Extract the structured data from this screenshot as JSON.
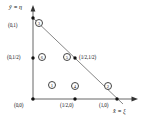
{
  "figure": {
    "axes": {
      "y_label": "ŷ ≡ η",
      "x_label": "x̂ ≡ ξ",
      "origin_label": "(0,0)"
    },
    "colors": {
      "line": "#4a4a4a",
      "axis": "#555555",
      "node": "#111111",
      "background": "#ffffff"
    },
    "vertices": [
      {
        "name": "origin",
        "coords": "(0,0)"
      },
      {
        "name": "x-vertex",
        "coords": "(1,0)"
      },
      {
        "name": "y-vertex",
        "coords": "(0,1)"
      }
    ],
    "nodes": [
      {
        "id": "1",
        "number": "1",
        "coord_label": "(0,0)",
        "x": 0.0,
        "y": 0.0,
        "label_pos": "below-left",
        "num_x": 48,
        "num_y": 81,
        "lbl_x": 14,
        "lbl_y": 103,
        "marker": true,
        "mx": 33,
        "my": 99
      },
      {
        "id": "2",
        "number": "2",
        "coord_label": "(1,0)",
        "x": 1.0,
        "y": 0.0,
        "label_pos": "below",
        "num_x": 104,
        "num_y": 82,
        "lbl_x": 99,
        "lbl_y": 103,
        "marker": true,
        "mx": 117,
        "my": 99
      },
      {
        "id": "3",
        "number": "3",
        "coord_label": "(0,1)",
        "x": 0.0,
        "y": 1.0,
        "label_pos": "left",
        "num_x": 35,
        "num_y": 19,
        "lbl_x": 8,
        "lbl_y": 23,
        "marker": true,
        "mx": 33,
        "my": 18
      },
      {
        "id": "4",
        "number": "4",
        "coord_label": "(1/2,0)",
        "x": 0.5,
        "y": 0.0,
        "label_pos": "below",
        "num_x": 71,
        "num_y": 82,
        "lbl_x": 60,
        "lbl_y": 103,
        "marker": true,
        "mx": 75,
        "my": 99
      },
      {
        "id": "5",
        "number": "5",
        "coord_label": "(1/2,1/2)",
        "x": 0.5,
        "y": 0.5,
        "label_pos": "right",
        "num_x": 63,
        "num_y": 53,
        "lbl_x": 79,
        "lbl_y": 55,
        "marker": true,
        "mx": 75,
        "my": 58
      },
      {
        "id": "6",
        "number": "6",
        "coord_label": "(0,1/2)",
        "x": 0.0,
        "y": 0.5,
        "label_pos": "left",
        "num_x": 38,
        "num_y": 53,
        "lbl_x": 7,
        "lbl_y": 55,
        "marker": true,
        "mx": 33,
        "my": 58
      }
    ]
  }
}
